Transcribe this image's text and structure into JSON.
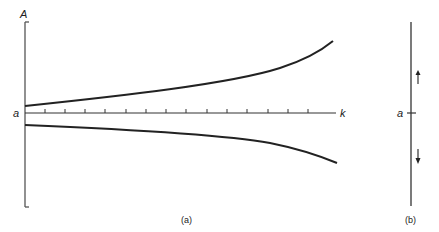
{
  "figure": {
    "panel_a": {
      "caption": "(a)",
      "y_axis_label": "A",
      "x_axis_label": "k",
      "origin_label": "a",
      "tick_count": 14,
      "curves": [
        {
          "name": "upper-branch",
          "description": "starts slightly above a at k=0 and rises increasingly with k"
        },
        {
          "name": "lower-branch",
          "description": "starts slightly below a at k=0 and falls increasingly with k"
        }
      ]
    },
    "panel_b": {
      "caption": "(b)",
      "point_label": "a",
      "arrows": [
        {
          "name": "arrow-up",
          "direction": "up",
          "position": "above a"
        },
        {
          "name": "arrow-down",
          "direction": "down",
          "position": "below a"
        }
      ]
    },
    "colors": {
      "ink": "#222222",
      "axis": "#555555",
      "background": "#ffffff"
    }
  }
}
